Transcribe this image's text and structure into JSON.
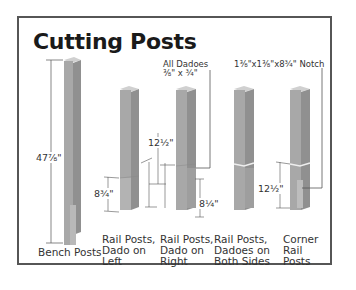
{
  "title": "Cutting Posts",
  "colors": {
    "frame": "#565656",
    "post_front": "#a9a9a9",
    "post_side": "#8f8f8f",
    "post_top": "#cfcfcf",
    "dimension_line": "#555555",
    "background": "#ffffff"
  },
  "callouts": {
    "dadoes": "All Dadoes\n⅜\" x ¾\"",
    "notch": "1⅜\"x1⅜\"x8¾\" Notch"
  },
  "dimensions": {
    "bench_height": "47⅞\"",
    "rail_left_dado": "8¾\"",
    "rail_right_upper": "12½\"",
    "rail_right_lower": "8¼\"",
    "corner_notch": "12½\""
  },
  "posts": [
    {
      "label": "Bench Posts"
    },
    {
      "label": "Rail Posts,\nDado on\nLeft"
    },
    {
      "label": "Rail Posts,\nDado on\nRight"
    },
    {
      "label": "Rail Posts,\nDadoes on\nBoth Sides"
    },
    {
      "label": "Corner\nRail\nPosts"
    }
  ]
}
